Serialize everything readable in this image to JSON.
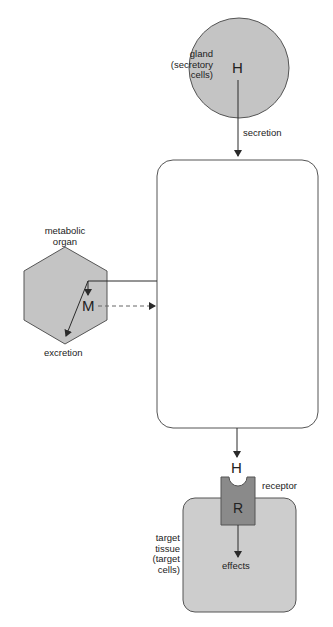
{
  "diagram": {
    "colors": {
      "shape_fill": "#c4c4c4",
      "tissue_fill": "#cdcdcd",
      "receptor_fill": "#8a8a8a",
      "stroke": "#3a3a3a",
      "background": "#ffffff"
    },
    "gland": {
      "label_line1": "gland",
      "label_line2": "(secretory",
      "label_line3": "cells)",
      "hormone": "H"
    },
    "arrows": {
      "secretion": "secretion"
    },
    "metabolic_organ": {
      "label_line1": "metabolic",
      "label_line2": "organ",
      "metabolite": "M",
      "excretion": "excretion"
    },
    "target": {
      "hormone": "H",
      "receptor_symbol": "R",
      "receptor_label": "receptor",
      "label_line1": "target",
      "label_line2": "tissue",
      "label_line3": "(target",
      "label_line4": "cells)",
      "effects": "effects"
    }
  }
}
